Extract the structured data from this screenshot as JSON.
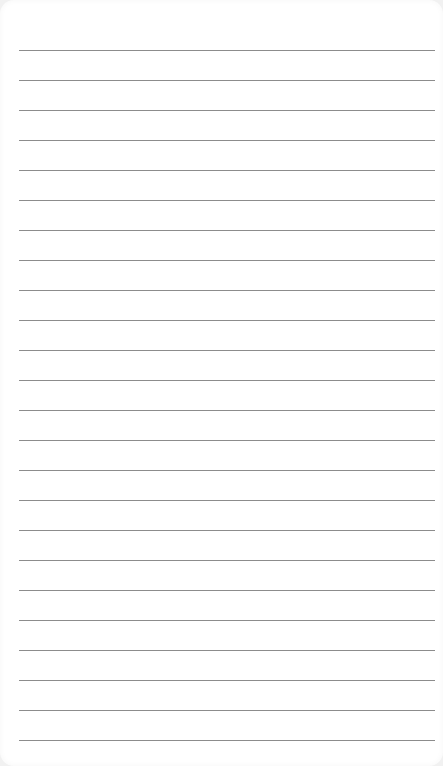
{
  "paper": {
    "type": "lined-notepad",
    "background_color": "#ffffff",
    "line_color": "#8c8c8c",
    "line_count": 24,
    "first_line_y": 50,
    "line_spacing": 30,
    "lines": [
      {
        "y": 50
      },
      {
        "y": 80
      },
      {
        "y": 110
      },
      {
        "y": 140
      },
      {
        "y": 170
      },
      {
        "y": 200
      },
      {
        "y": 230
      },
      {
        "y": 260
      },
      {
        "y": 290
      },
      {
        "y": 320
      },
      {
        "y": 350
      },
      {
        "y": 380
      },
      {
        "y": 410
      },
      {
        "y": 440
      },
      {
        "y": 470
      },
      {
        "y": 500
      },
      {
        "y": 530
      },
      {
        "y": 560
      },
      {
        "y": 590
      },
      {
        "y": 620
      },
      {
        "y": 650
      },
      {
        "y": 680
      },
      {
        "y": 710
      },
      {
        "y": 740
      }
    ]
  }
}
